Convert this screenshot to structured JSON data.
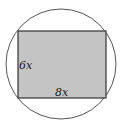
{
  "diagram": {
    "circle": {
      "cx": 61,
      "cy": 64,
      "r": 55,
      "stroke": "#555555"
    },
    "rectangle": {
      "x": 18,
      "y": 31,
      "width": 88,
      "height": 67,
      "fill": "#c4c4c4",
      "stroke": "#333333"
    },
    "labels": {
      "side_height": "6x",
      "side_width": "8x"
    }
  }
}
